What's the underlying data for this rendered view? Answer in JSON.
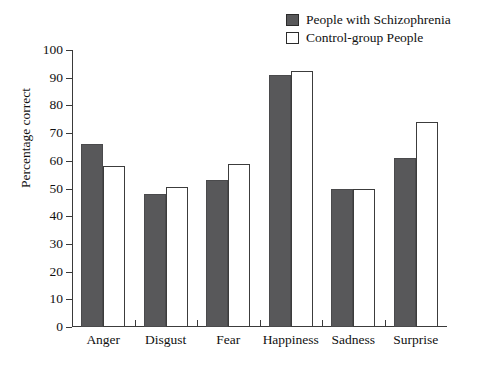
{
  "chart_data": {
    "type": "bar",
    "title": "",
    "xlabel": "",
    "ylabel": "Percentage correct",
    "ylim": [
      0,
      100
    ],
    "ytick_step": 10,
    "yticks": [
      0,
      10,
      20,
      30,
      40,
      50,
      60,
      70,
      80,
      90,
      100
    ],
    "grid": false,
    "legend_position": "top-right",
    "categories": [
      "Anger",
      "Disgust",
      "Fear",
      "Happiness",
      "Sadness",
      "Surprise"
    ],
    "series": [
      {
        "name": "People with Schizophrenia",
        "color": "#58585a",
        "values": [
          66,
          48,
          53,
          91,
          50,
          61
        ]
      },
      {
        "name": "Control-group People",
        "color": "#ffffff",
        "values": [
          58,
          50.5,
          59,
          92.5,
          50,
          74
        ]
      }
    ]
  },
  "legend": {
    "items": [
      {
        "label": "People with Schizophrenia",
        "swatch": "dark"
      },
      {
        "label": "Control-group People",
        "swatch": "light"
      }
    ]
  },
  "colors": {
    "bar_dark": "#58585a",
    "bar_light": "#ffffff",
    "axis": "#3a3a3a",
    "text": "#111111",
    "background": "#ffffff"
  }
}
